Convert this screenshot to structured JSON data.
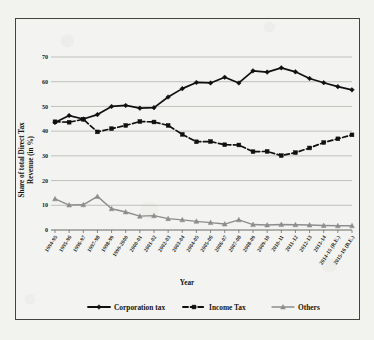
{
  "figure": {
    "background_color": "#f2f2ef",
    "border_color": "#43433f"
  },
  "chart_data": {
    "type": "line",
    "title": "",
    "xlabel": "Year",
    "ylabel": "Share of total Direct Tax Revenue (in %)",
    "ylabel_line1": "Share of total Direct Tax",
    "ylabel_line2": "Revenue (in %)",
    "ylim": [
      0,
      70
    ],
    "yticks": [
      0,
      10,
      20,
      30,
      40,
      50,
      60,
      70
    ],
    "ytick_labels": [
      "0",
      "10",
      "20",
      "30",
      "40",
      "50",
      "60",
      "70"
    ],
    "grid": true,
    "legend_position": "bottom",
    "categories": [
      "1994-95",
      "1995-96",
      "1996-97",
      "1997-98",
      "1998-99",
      "1999-2000",
      "2000-01",
      "2001-02",
      "2002-03",
      "2003-04",
      "2004-05",
      "2005-06",
      "2006-07",
      "2007-08",
      "2008-09",
      "2009-10",
      "2010-11",
      "2011-12",
      "2012-13",
      "2013-14",
      "2014-15 (R.E.)",
      "2015-16 (B.E.)"
    ],
    "series": [
      {
        "name": "Corporation tax",
        "color": "#101010",
        "style": "solid",
        "marker": "diamond",
        "values": [
          43.5,
          46.3,
          44.9,
          46.7,
          50.0,
          50.4,
          49.3,
          49.5,
          53.8,
          57.2,
          59.7,
          59.5,
          61.8,
          59.5,
          64.4,
          63.9,
          65.6,
          64.0,
          61.3,
          59.6,
          58.0,
          56.7
        ]
      },
      {
        "name": "Income Tax",
        "color": "#101010",
        "style": "dashed",
        "marker": "square",
        "values": [
          43.8,
          43.6,
          44.8,
          39.7,
          41.0,
          42.3,
          43.9,
          43.7,
          42.3,
          38.7,
          35.7,
          35.8,
          34.5,
          34.4,
          31.7,
          31.8,
          30.1,
          31.3,
          33.2,
          35.4,
          36.9,
          38.5
        ]
      },
      {
        "name": "Others",
        "color": "#8d8d8d",
        "style": "solid",
        "marker": "triangle",
        "values": [
          12.6,
          10.1,
          10.2,
          13.6,
          8.6,
          7.3,
          5.6,
          5.8,
          4.6,
          4.1,
          3.5,
          3.0,
          2.4,
          4.1,
          2.2,
          2.0,
          2.2,
          2.1,
          2.0,
          1.8,
          1.7,
          1.7
        ]
      }
    ]
  }
}
